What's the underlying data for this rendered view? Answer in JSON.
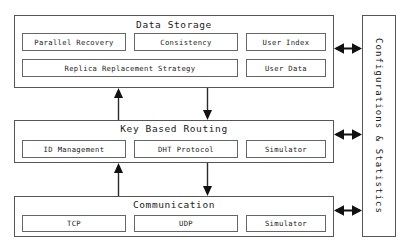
{
  "diagram": {
    "colors": {
      "stroke": "#555555",
      "component_stroke": "#666666",
      "text": "#1a1a1a",
      "background": "#ffffff"
    },
    "layers": [
      {
        "id": "data-storage",
        "title": "Data Storage",
        "components": [
          {
            "label": "Parallel Recovery"
          },
          {
            "label": "Consistency"
          },
          {
            "label": "User Index"
          },
          {
            "label": "Replica Replacement Strategy"
          },
          {
            "label": "User Data"
          }
        ]
      },
      {
        "id": "key-based-routing",
        "title": "Key Based Routing",
        "components": [
          {
            "label": "ID Management"
          },
          {
            "label": "DHT Protocol"
          },
          {
            "label": "Simulator"
          }
        ]
      },
      {
        "id": "communication",
        "title": "Communication",
        "components": [
          {
            "label": "TCP"
          },
          {
            "label": "UDP"
          },
          {
            "label": "Simulator"
          }
        ]
      }
    ],
    "side_panel": {
      "label": "Configurations & Statistics",
      "orientation": "vertical"
    },
    "connectors": [
      {
        "name": "storage-to-routing-up",
        "direction": "up",
        "icon": "arrow-up-icon"
      },
      {
        "name": "storage-to-routing-down",
        "direction": "down",
        "icon": "arrow-down-icon"
      },
      {
        "name": "routing-to-communication-up",
        "direction": "up",
        "icon": "arrow-up-icon"
      },
      {
        "name": "routing-to-communication-down",
        "direction": "down",
        "icon": "arrow-down-icon"
      },
      {
        "name": "storage-to-side-panel",
        "direction": "both",
        "icon": "arrow-double-horizontal-icon"
      },
      {
        "name": "routing-to-side-panel",
        "direction": "both",
        "icon": "arrow-double-horizontal-icon"
      },
      {
        "name": "communication-to-side-panel",
        "direction": "both",
        "icon": "arrow-double-horizontal-icon"
      }
    ]
  }
}
